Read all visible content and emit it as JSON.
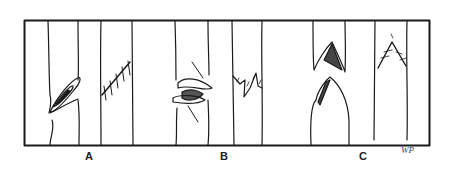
{
  "figure": {
    "panels": [
      {
        "label": "A",
        "description": "Oblique cut in stem, tied with oblique stitched suture"
      },
      {
        "label": "B",
        "description": "Split/crushed stem with torn flaps, repaired with zig-zag suture"
      },
      {
        "label": "C",
        "description": "V-shaped (chevron) cut in stem, repaired with chevron suture"
      }
    ],
    "signature": "WP",
    "colors": {
      "ink": "#1a1a1a",
      "background": "#ffffff"
    }
  }
}
